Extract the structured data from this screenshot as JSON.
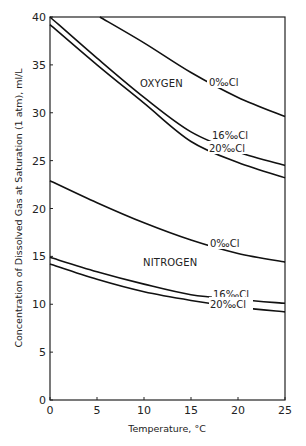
{
  "chart_data": {
    "type": "line",
    "title": "",
    "xlabel": "Temperature, °C",
    "ylabel": "Concentration of Dissolved Gas at Saturation (1 atm), ml/L",
    "xlim": [
      0,
      25
    ],
    "ylim": [
      0,
      40
    ],
    "x_ticks": [
      0,
      5,
      10,
      15,
      20,
      25
    ],
    "y_ticks": [
      0,
      5,
      10,
      15,
      20,
      25,
      30,
      35,
      40
    ],
    "grid": false,
    "legend": "inline labels",
    "annotations": [
      "OXYGEN",
      "NITROGEN"
    ],
    "series": [
      {
        "name": "Oxygen 0‰Cl",
        "group": "OXYGEN",
        "label": "0‰Cl",
        "points": [
          [
            5.3,
            40.0
          ],
          [
            10,
            37.3
          ],
          [
            15,
            34.2
          ],
          [
            20,
            31.6
          ],
          [
            25,
            29.6
          ]
        ]
      },
      {
        "name": "Oxygen 16‰Cl",
        "group": "OXYGEN",
        "label": "16‰Cl",
        "points": [
          [
            0,
            40.0
          ],
          [
            5,
            35.7
          ],
          [
            10,
            31.6
          ],
          [
            15,
            28.0
          ],
          [
            20,
            25.9
          ],
          [
            25,
            24.5
          ]
        ]
      },
      {
        "name": "Oxygen 20‰Cl",
        "group": "OXYGEN",
        "label": "20‰Cl",
        "points": [
          [
            0,
            39.2
          ],
          [
            5,
            35.0
          ],
          [
            10,
            31.0
          ],
          [
            15,
            27.0
          ],
          [
            20,
            24.8
          ],
          [
            25,
            23.2
          ]
        ]
      },
      {
        "name": "Nitrogen 0‰Cl",
        "group": "NITROGEN",
        "label": "0‰Cl",
        "points": [
          [
            0,
            22.9
          ],
          [
            5,
            20.6
          ],
          [
            10,
            18.5
          ],
          [
            15,
            16.7
          ],
          [
            20,
            15.3
          ],
          [
            25,
            14.4
          ]
        ]
      },
      {
        "name": "Nitrogen 16‰Cl",
        "group": "NITROGEN",
        "label": "16‰Cl",
        "points": [
          [
            0,
            14.9
          ],
          [
            5,
            13.4
          ],
          [
            10,
            12.1
          ],
          [
            15,
            11.0
          ],
          [
            20,
            10.5
          ],
          [
            25,
            10.1
          ]
        ]
      },
      {
        "name": "Nitrogen 20‰Cl",
        "group": "NITROGEN",
        "label": "20‰Cl",
        "points": [
          [
            0,
            14.2
          ],
          [
            5,
            12.6
          ],
          [
            10,
            11.3
          ],
          [
            15,
            10.4
          ],
          [
            20,
            9.7
          ],
          [
            25,
            9.2
          ]
        ]
      }
    ]
  },
  "labels": {
    "oxygen": "OXYGEN",
    "nitrogen": "NITROGEN",
    "o2_0": "0‰Cl",
    "o2_16": "16‰Cl",
    "o2_20": "20‰Cl",
    "n2_0": "0‰Cl",
    "n2_16": "16‰Cl",
    "n2_20": "20‰Cl",
    "xlabel": "Temperature, °C",
    "ylabel": "Concentration of Dissolved Gas at Saturation (1 atm), ml/L"
  }
}
